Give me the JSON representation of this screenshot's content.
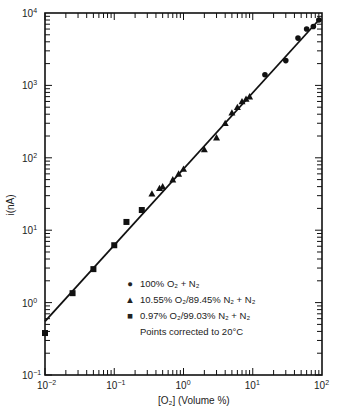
{
  "chart_data": {
    "type": "scatter",
    "title": "",
    "xlabel": "[O2] (Volume %)",
    "ylabel": "i(nA)",
    "xscale": "log",
    "yscale": "log",
    "xlim": [
      0.01,
      100
    ],
    "ylim": [
      0.1,
      10000
    ],
    "x_tick_labels": [
      "10^-2",
      "10^-1",
      "10^0",
      "10^1",
      "10^2"
    ],
    "y_tick_labels": [
      "10^-1",
      "10^0",
      "10^1",
      "10^2",
      "10^3",
      "10^4"
    ],
    "grid": false,
    "legend_position": "lower right (inside plot)",
    "fit_line": {
      "x": [
        0.01,
        90
      ],
      "y": [
        0.55,
        8000
      ]
    },
    "series": [
      {
        "name": "100% O2 + N2",
        "marker": "circle",
        "x": [
          15,
          30,
          45,
          60,
          75,
          90
        ],
        "y": [
          1400,
          2200,
          4500,
          6000,
          6500,
          8000
        ]
      },
      {
        "name": "10.55% O2/89.45% N2 + N2",
        "marker": "triangle",
        "x": [
          0.35,
          0.45,
          0.5,
          0.7,
          0.85,
          1.0,
          2.0,
          3.0,
          4.0,
          5.0,
          6.0,
          7.0,
          8.0,
          9.0
        ],
        "y": [
          32,
          38,
          40,
          50,
          60,
          70,
          130,
          190,
          300,
          420,
          500,
          600,
          650,
          700
        ]
      },
      {
        "name": "0.97% O2/99.03% N2 + N2",
        "marker": "square",
        "x": [
          0.01,
          0.025,
          0.05,
          0.1,
          0.15,
          0.25
        ],
        "y": [
          0.38,
          1.35,
          2.9,
          6.2,
          13,
          19
        ]
      }
    ],
    "annotations": [
      "Points corrected to 20°C"
    ]
  },
  "legend": {
    "items": [
      {
        "marker": "●",
        "label": "100% O₂ + N₂"
      },
      {
        "marker": "▲",
        "label": "10.55% O₂/89.45% N₂ + N₂"
      },
      {
        "marker": "■",
        "label": "0.97% O₂/99.03% N₂ + N₂"
      }
    ],
    "note": "Points corrected to 20°C"
  },
  "axes": {
    "x_label": "[O₂]  (Volume %)",
    "y_label": "i(nA)"
  }
}
